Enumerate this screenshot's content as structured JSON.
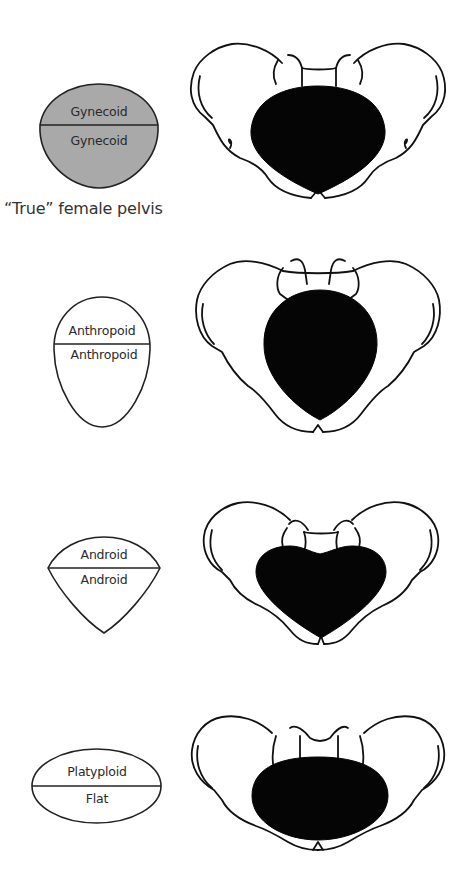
{
  "figure": {
    "caption": "“True” female pelvis",
    "colors": {
      "gynecoid_fill": "#a9a9a9",
      "outline": "#111111",
      "inlet": "#050505",
      "background": "#ffffff"
    },
    "rows": [
      {
        "type": "gynecoid",
        "shape": "round",
        "upper_label": "Gynecoid",
        "lower_label": "Gynecoid",
        "highlighted": true,
        "note": "“True” female pelvis"
      },
      {
        "type": "anthropoid",
        "shape": "egg",
        "upper_label": "Anthropoid",
        "lower_label": "Anthropoid",
        "highlighted": false
      },
      {
        "type": "android",
        "shape": "heart",
        "upper_label": "Android",
        "lower_label": "Android",
        "highlighted": false
      },
      {
        "type": "platypelloid",
        "shape": "flat-oval",
        "upper_label": "Platyploid",
        "lower_label": "Flat",
        "highlighted": false
      }
    ]
  }
}
